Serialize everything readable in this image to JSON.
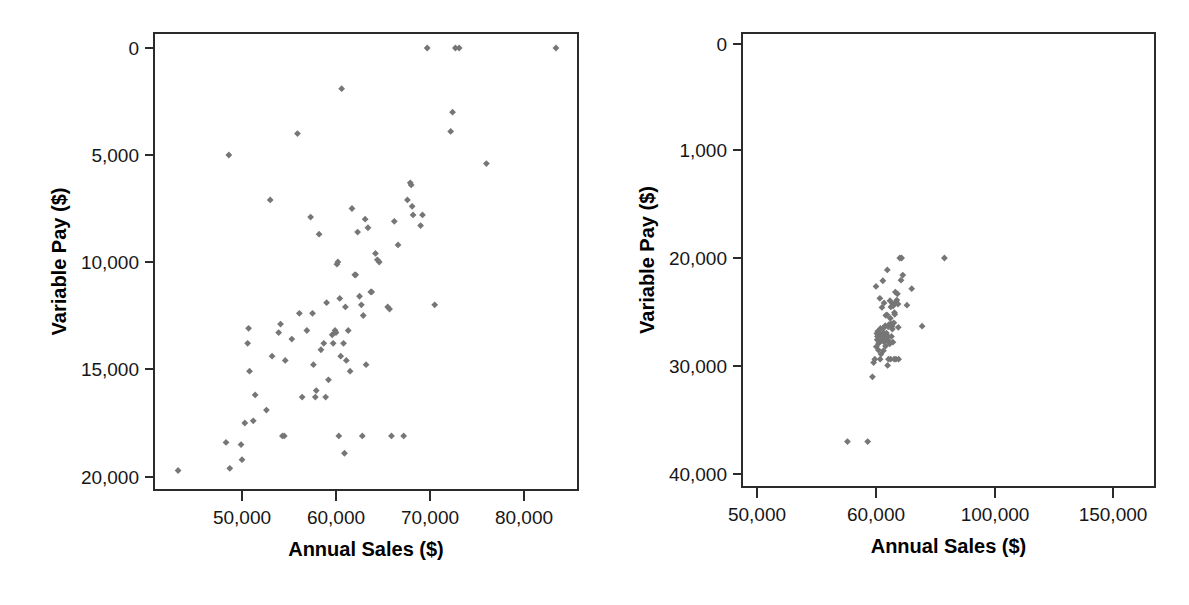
{
  "figure": {
    "background_color": "#ffffff",
    "marker_color": "#767676",
    "axis_color": "#2b2b2b",
    "text_color": "#161616"
  },
  "chart_data": [
    {
      "type": "scatter",
      "panel": "left",
      "title": "",
      "xlabel": "Annual Sales ($)",
      "ylabel": "Variable Pay ($)",
      "xticks": [
        50000,
        60000,
        70000,
        80000
      ],
      "xticklabels": [
        "50,000",
        "60,000",
        "70,000",
        "80,000"
      ],
      "yticks": [
        0,
        5000,
        10000,
        15000,
        20000
      ],
      "yticklabels": [
        "0",
        "5,000",
        "10,000",
        "15,000",
        "20,000"
      ],
      "xlim": [
        43000,
        85000
      ],
      "ylim": [
        -800,
        20900
      ],
      "grid": false,
      "legend": null,
      "marker": "diamond",
      "points": [
        [
          43200,
          300
        ],
        [
          48300,
          1600
        ],
        [
          48600,
          15000
        ],
        [
          48700,
          400
        ],
        [
          49900,
          1500
        ],
        [
          50000,
          800
        ],
        [
          50300,
          2500
        ],
        [
          50600,
          6200
        ],
        [
          50700,
          6900
        ],
        [
          50800,
          4900
        ],
        [
          51200,
          2600
        ],
        [
          51400,
          3800
        ],
        [
          52600,
          3100
        ],
        [
          53000,
          12900
        ],
        [
          53200,
          5600
        ],
        [
          53900,
          6700
        ],
        [
          54100,
          7100
        ],
        [
          54300,
          1900
        ],
        [
          54500,
          1900
        ],
        [
          54600,
          5400
        ],
        [
          55300,
          6400
        ],
        [
          55900,
          16000
        ],
        [
          56100,
          7600
        ],
        [
          56400,
          3700
        ],
        [
          56900,
          6800
        ],
        [
          57300,
          12100
        ],
        [
          57500,
          7600
        ],
        [
          57600,
          5200
        ],
        [
          57800,
          3700
        ],
        [
          57900,
          4000
        ],
        [
          58200,
          11300
        ],
        [
          58400,
          5900
        ],
        [
          58700,
          6200
        ],
        [
          58900,
          3700
        ],
        [
          59000,
          8100
        ],
        [
          59200,
          4500
        ],
        [
          59600,
          6600
        ],
        [
          59700,
          6200
        ],
        [
          59900,
          6800
        ],
        [
          60000,
          6700
        ],
        [
          60100,
          9900
        ],
        [
          60200,
          10000
        ],
        [
          60300,
          1900
        ],
        [
          60400,
          8300
        ],
        [
          60500,
          5600
        ],
        [
          60600,
          18100
        ],
        [
          60800,
          6200
        ],
        [
          60900,
          1100
        ],
        [
          61000,
          7900
        ],
        [
          61100,
          5400
        ],
        [
          61300,
          6800
        ],
        [
          61500,
          4900
        ],
        [
          61700,
          12500
        ],
        [
          62000,
          9400
        ],
        [
          62100,
          9400
        ],
        [
          62300,
          11400
        ],
        [
          62500,
          8400
        ],
        [
          62700,
          8000
        ],
        [
          62800,
          1900
        ],
        [
          62900,
          7500
        ],
        [
          63100,
          12000
        ],
        [
          63200,
          5200
        ],
        [
          63400,
          11600
        ],
        [
          63700,
          8600
        ],
        [
          63800,
          8600
        ],
        [
          64200,
          10400
        ],
        [
          64400,
          10100
        ],
        [
          64600,
          10000
        ],
        [
          65500,
          7900
        ],
        [
          65700,
          7800
        ],
        [
          65900,
          1900
        ],
        [
          66200,
          11900
        ],
        [
          66600,
          10800
        ],
        [
          67200,
          1900
        ],
        [
          67600,
          12900
        ],
        [
          67900,
          13700
        ],
        [
          68000,
          13600
        ],
        [
          68100,
          12600
        ],
        [
          68200,
          12200
        ],
        [
          69000,
          11700
        ],
        [
          69200,
          12200
        ],
        [
          69700,
          20000
        ],
        [
          70500,
          8000
        ],
        [
          72200,
          16100
        ],
        [
          72400,
          17000
        ],
        [
          72700,
          20000
        ],
        [
          73100,
          20000
        ],
        [
          76000,
          14600
        ],
        [
          83400,
          20000
        ]
      ]
    },
    {
      "type": "scatter",
      "panel": "right",
      "title": "",
      "xlabel": "Annual Sales ($)",
      "ylabel": "Variable Pay ($)",
      "xticks": [
        50000,
        60000,
        100000,
        150000
      ],
      "xticklabels": [
        "50,000",
        "60,000",
        "100,000",
        "150,000"
      ],
      "yticks": [
        0,
        1000,
        20000,
        30000,
        40000
      ],
      "yticklabels": [
        "0",
        "1,000",
        "20,000",
        "30,000",
        "40,000"
      ],
      "xlim": [
        46000,
        165000
      ],
      "ylim": [
        -1200,
        41500
      ],
      "grid": false,
      "legend": null,
      "marker": "diamond",
      "note": "Axis tick labels are non-linearly spaced as drawn: x ticks and y ticks are at equal pixel intervals despite unequal value gaps.",
      "points": [
        [
          57600,
          300
        ],
        [
          59300,
          300
        ],
        [
          59700,
          900
        ],
        [
          59800,
          1600
        ],
        [
          59900,
          2200
        ],
        [
          60000,
          15000
        ],
        [
          60100,
          4400
        ],
        [
          60300,
          6700
        ],
        [
          60400,
          5600
        ],
        [
          60500,
          6200
        ],
        [
          60600,
          7100
        ],
        [
          60800,
          3800
        ],
        [
          60900,
          5000
        ],
        [
          61000,
          6800
        ],
        [
          61200,
          6400
        ],
        [
          61300,
          12900
        ],
        [
          61400,
          2200
        ],
        [
          61500,
          7600
        ],
        [
          61600,
          5400
        ],
        [
          61700,
          3100
        ],
        [
          61900,
          6200
        ],
        [
          62000,
          11300
        ],
        [
          62100,
          5900
        ],
        [
          62200,
          6700
        ],
        [
          62300,
          16000
        ],
        [
          62400,
          7600
        ],
        [
          62500,
          3700
        ],
        [
          62600,
          6800
        ],
        [
          62700,
          12100
        ],
        [
          62800,
          5200
        ],
        [
          63000,
          6200
        ],
        [
          63100,
          8100
        ],
        [
          63200,
          4500
        ],
        [
          63300,
          9900
        ],
        [
          63400,
          6600
        ],
        [
          63500,
          6800
        ],
        [
          63600,
          5600
        ],
        [
          63700,
          10000
        ],
        [
          63800,
          17900
        ],
        [
          63900,
          1100
        ],
        [
          64000,
          6200
        ],
        [
          64100,
          7900
        ],
        [
          64200,
          2200
        ],
        [
          64300,
          5400
        ],
        [
          64400,
          8300
        ],
        [
          64600,
          4900
        ],
        [
          64700,
          12500
        ],
        [
          64800,
          9400
        ],
        [
          64900,
          2200
        ],
        [
          65000,
          11400
        ],
        [
          65100,
          8400
        ],
        [
          65200,
          6200
        ],
        [
          65400,
          8000
        ],
        [
          65500,
          7500
        ],
        [
          65600,
          12000
        ],
        [
          65700,
          5200
        ],
        [
          65800,
          11600
        ],
        [
          66000,
          8600
        ],
        [
          66100,
          2200
        ],
        [
          66200,
          10400
        ],
        [
          66300,
          10100
        ],
        [
          66500,
          14000
        ],
        [
          66700,
          2200
        ],
        [
          66800,
          12200
        ],
        [
          67000,
          12600
        ],
        [
          67200,
          13700
        ],
        [
          67400,
          11900
        ],
        [
          67500,
          7800
        ],
        [
          67600,
          2200
        ],
        [
          68000,
          20000
        ],
        [
          68400,
          16100
        ],
        [
          68600,
          20000
        ],
        [
          69000,
          17000
        ],
        [
          70400,
          11700
        ],
        [
          72000,
          14600
        ],
        [
          75500,
          8000
        ],
        [
          83000,
          20000
        ]
      ]
    }
  ]
}
